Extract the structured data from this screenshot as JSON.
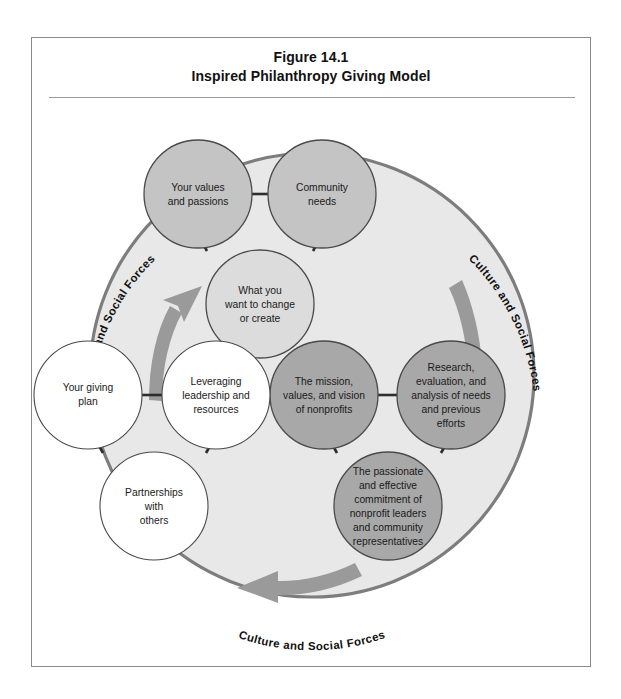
{
  "figure": {
    "title_line1": "Figure 14.1",
    "title_line2": "Inspired Philanthropy Giving Model"
  },
  "diagram": {
    "type": "cycle-diagram",
    "outer_circle": {
      "fill": "#e8e8e8",
      "stroke": "#7d7d7d",
      "label_text": "Culture and Social Forces",
      "label_positions": [
        "upper-left",
        "upper-right",
        "bottom-center"
      ],
      "labels": [
        "Culture and Social Forces",
        "Culture and Social Forces",
        "Culture and Social Forces"
      ]
    },
    "arrows": [
      {
        "name": "arrow-left-upward",
        "direction": "up-right",
        "color": "#9a9a9a"
      },
      {
        "name": "arrow-right-downward",
        "direction": "down",
        "color": "#9a9a9a"
      },
      {
        "name": "arrow-bottom-leftward",
        "direction": "left",
        "color": "#9a9a9a"
      }
    ],
    "clusters": [
      {
        "name": "donor-cluster",
        "fill": "#c4c4c4",
        "accent_fill": "#dcdcdc",
        "nodes": [
          {
            "id": "your-values",
            "lines": [
              "Your values",
              "and passions"
            ],
            "fill": "#c4c4c4"
          },
          {
            "id": "community-needs",
            "lines": [
              "Community",
              "needs"
            ],
            "fill": "#c4c4c4"
          },
          {
            "id": "what-you-want-to-change",
            "lines": [
              "What you",
              "want to change",
              "or create"
            ],
            "fill": "#dcdcdc"
          }
        ]
      },
      {
        "name": "nonprofit-cluster",
        "fill": "#a8a8a8",
        "nodes": [
          {
            "id": "mission-values-vision",
            "lines": [
              "The mission,",
              "values, and vision",
              "of nonprofits"
            ],
            "fill": "#a8a8a8"
          },
          {
            "id": "research-evaluation",
            "lines": [
              "Research,",
              "evaluation, and",
              "analysis of needs",
              "and previous",
              "efforts"
            ],
            "fill": "#a8a8a8"
          },
          {
            "id": "passionate-commitment",
            "lines": [
              "The passionate",
              "and effective",
              "commitment of",
              "nonprofit leaders",
              "and community",
              "representatives"
            ],
            "fill": "#a8a8a8"
          }
        ]
      },
      {
        "name": "plan-cluster",
        "fill": "#ffffff",
        "nodes": [
          {
            "id": "your-giving-plan",
            "lines": [
              "Your giving",
              "plan"
            ],
            "fill": "#ffffff"
          },
          {
            "id": "leveraging-leadership",
            "lines": [
              "Leveraging",
              "leadership and",
              "resources"
            ],
            "fill": "#ffffff"
          },
          {
            "id": "partnerships-with-others",
            "lines": [
              "Partnerships",
              "with",
              "others"
            ],
            "fill": "#ffffff"
          }
        ]
      }
    ]
  }
}
